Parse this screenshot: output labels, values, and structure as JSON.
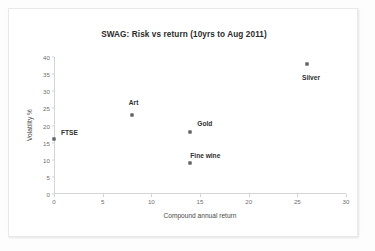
{
  "chart_data": {
    "type": "scatter",
    "title": "SWAG: Risk vs return (10yrs to Aug 2011)",
    "xlabel": "Compound annual return",
    "ylabel": "Volatility %",
    "xlim": [
      0,
      30
    ],
    "ylim": [
      0,
      40
    ],
    "xticks": [
      "0",
      "5",
      "10",
      "15",
      "20",
      "25",
      "30"
    ],
    "yticks": [
      "0",
      "5",
      "10",
      "15",
      "20",
      "25",
      "30",
      "35",
      "40"
    ],
    "grid": false,
    "legend": "none",
    "marker_color": "#808080",
    "points": [
      {
        "label": "FTSE",
        "x": 0,
        "y": 16
      },
      {
        "label": "Art",
        "x": 8,
        "y": 23
      },
      {
        "label": "Gold",
        "x": 14,
        "y": 18
      },
      {
        "label": "Fine wine",
        "x": 14,
        "y": 9
      },
      {
        "label": "Silver",
        "x": 26,
        "y": 38
      }
    ]
  }
}
